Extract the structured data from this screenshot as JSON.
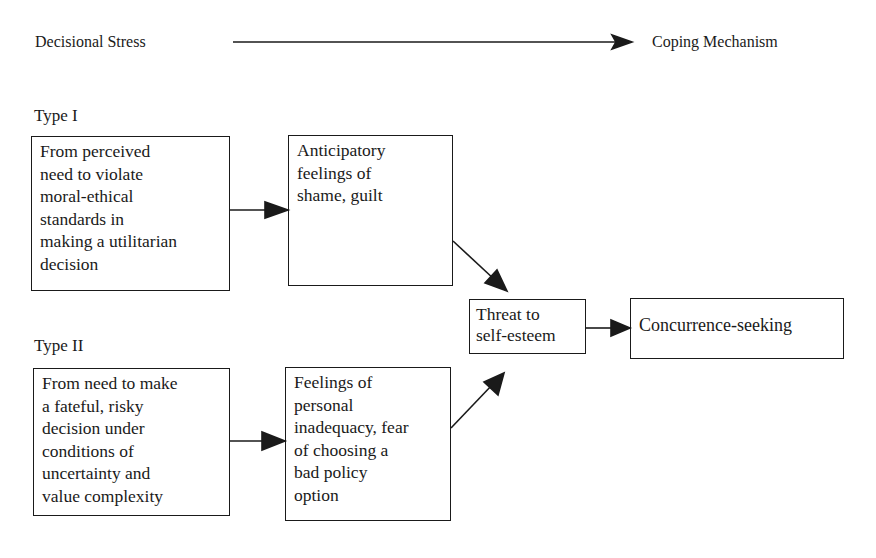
{
  "header": {
    "left_label": "Decisional Stress",
    "right_label": "Coping Mechanism"
  },
  "types": [
    {
      "label": "Type I",
      "stress_box": [
        "From perceived",
        "need to violate",
        "moral-ethical",
        "standards in",
        "making a utilitarian",
        "decision"
      ],
      "feeling_box": [
        "Anticipatory",
        "feelings of",
        "shame, guilt"
      ]
    },
    {
      "label": "Type II",
      "stress_box": [
        "From need to make",
        "a fateful, risky",
        "decision under",
        "conditions of",
        "uncertainty and",
        "value complexity"
      ],
      "feeling_box": [
        "Feelings of",
        "personal",
        "inadequacy, fear",
        "of choosing a",
        "bad policy",
        "option"
      ]
    }
  ],
  "threat_box": [
    "Threat to",
    "self-esteem"
  ],
  "outcome_box": [
    "Concurrence-seeking"
  ],
  "colors": {
    "ink": "#1a1a1a",
    "background": "#ffffff"
  }
}
